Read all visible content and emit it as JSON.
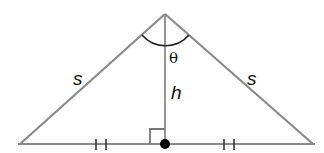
{
  "diagram": {
    "type": "isosceles-triangle-with-altitude",
    "colors": {
      "line": "#8a8a8a",
      "text": "#111111",
      "dot": "#000000",
      "background": "#ffffff"
    },
    "vertices": {
      "apex": [
        165,
        14
      ],
      "left_base": [
        20,
        144
      ],
      "right_base": [
        313,
        144
      ],
      "foot": [
        165,
        144
      ]
    },
    "labels": {
      "left_side": "s",
      "right_side": "s",
      "altitude": "h",
      "apex_angle": "θ"
    },
    "marks": {
      "right_angle_at_foot": true,
      "congruent_ticks_per_half": 2,
      "foot_dot": true,
      "apex_angle_arc": true
    }
  }
}
